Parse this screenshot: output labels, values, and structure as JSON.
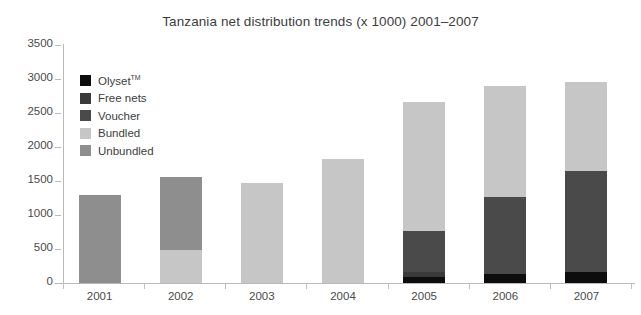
{
  "chart_data": {
    "type": "bar",
    "subtype": "stacked-bar",
    "title": "Tanzania net distribution trends (x 1000) 2001–2007",
    "xlabel": "",
    "ylabel": "",
    "ylim": [
      0,
      3500
    ],
    "ytick_step": 500,
    "yticks": [
      "0",
      "500",
      "1000",
      "1500",
      "2000",
      "2500",
      "3000",
      "3500"
    ],
    "grid": false,
    "legend_position": "inside-top-left",
    "categories": [
      "2001",
      "2002",
      "2003",
      "2004",
      "2005",
      "2006",
      "2007"
    ],
    "series": [
      {
        "name": "Olyset™",
        "color": "#0d0d0d",
        "values": [
          0,
          0,
          0,
          0,
          90,
          130,
          155
        ]
      },
      {
        "name": "Free nets",
        "color": "#3a3a3a",
        "values": [
          0,
          0,
          0,
          0,
          70,
          0,
          0
        ]
      },
      {
        "name": "Voucher",
        "color": "#4a4a4a",
        "values": [
          0,
          0,
          0,
          0,
          610,
          1130,
          1495
        ]
      },
      {
        "name": "Bundled",
        "color": "#c6c6c6",
        "values": [
          0,
          490,
          1470,
          1820,
          1890,
          1640,
          1310
        ]
      },
      {
        "name": "Unbundled",
        "color": "#8e8e8e",
        "values": [
          1290,
          1070,
          0,
          0,
          0,
          0,
          0
        ]
      }
    ],
    "totals": [
      1290,
      1560,
      1470,
      1820,
      2660,
      2900,
      2960
    ]
  },
  "legend": {
    "items": [
      {
        "label": "Olyset",
        "trademark": "TM",
        "color": "#0d0d0d"
      },
      {
        "label": "Free nets",
        "trademark": "",
        "color": "#3a3a3a"
      },
      {
        "label": "Voucher",
        "trademark": "",
        "color": "#4a4a4a"
      },
      {
        "label": "Bundled",
        "trademark": "",
        "color": "#c6c6c6"
      },
      {
        "label": "Unbundled",
        "trademark": "",
        "color": "#8e8e8e"
      }
    ]
  }
}
